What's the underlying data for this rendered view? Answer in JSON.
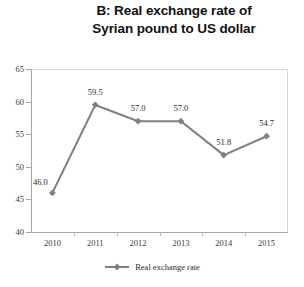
{
  "chart_data": {
    "type": "line",
    "title": "B: Real exchange rate of Syrian pound to US dollar",
    "title_lines": [
      "B: Real exchange rate of",
      "Syrian pound to US dollar"
    ],
    "xlabel": "",
    "ylabel": "",
    "categories": [
      "2010",
      "2011",
      "2012",
      "2013",
      "2014",
      "2015"
    ],
    "values": [
      46.0,
      59.5,
      57.0,
      57.0,
      51.8,
      54.7
    ],
    "point_labels": [
      "46.0",
      "59.5",
      "57.0",
      "57.0",
      "51.8",
      "54.7"
    ],
    "series": [
      {
        "name": "Real exchange rate",
        "values": [
          46.0,
          59.5,
          57.0,
          57.0,
          51.8,
          54.7
        ],
        "color": "#808080",
        "marker": "diamond"
      }
    ],
    "ylim": [
      40,
      65
    ],
    "yticks": [
      40,
      45,
      50,
      55,
      60,
      65
    ],
    "ytick_labels": [
      "40",
      "45",
      "50",
      "55",
      "60",
      "65"
    ],
    "grid": false,
    "legend_position": "bottom",
    "legend_entries": [
      "Real exchange rate"
    ]
  },
  "legend": {
    "label": "Real exchange rate"
  },
  "colors": {
    "series": "#808080",
    "axis": "#a6a6a6",
    "frame": "#d8d8d8",
    "text": "#2b2b2b",
    "background": "#ffffff"
  }
}
